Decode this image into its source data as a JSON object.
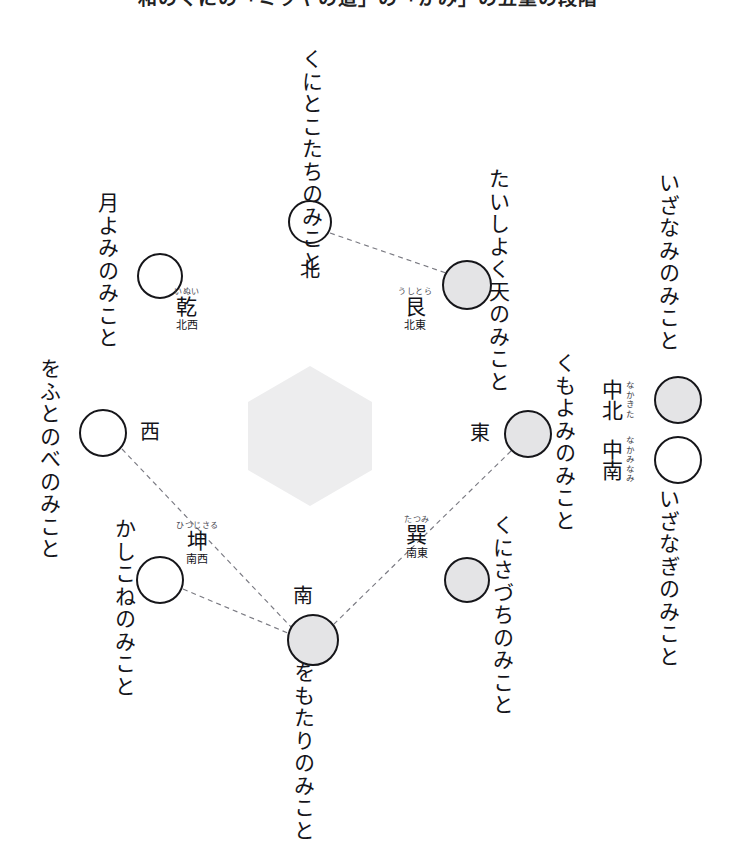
{
  "title": "和のくにの「ミヲヤの道」の「かみ」の五重の段階",
  "colors": {
    "ink": "#16161a",
    "node_white": "#ffffff",
    "node_gray": "#e4e4e6",
    "hexagon": "#ededee",
    "dashed_line": "#7a7a82",
    "ruby": "#4a4a52"
  },
  "hexagon": {
    "name": "center-hexagon",
    "fill": "#ededee"
  },
  "nodes": [
    {
      "id": "north",
      "fill": "white",
      "cx": 310,
      "cy": 222,
      "r": 22
    },
    {
      "id": "northeast",
      "fill": "gray",
      "cx": 467,
      "cy": 285,
      "r": 25
    },
    {
      "id": "northwest",
      "fill": "white",
      "cx": 160,
      "cy": 276,
      "r": 23
    },
    {
      "id": "west",
      "fill": "white",
      "cx": 103,
      "cy": 433,
      "r": 24
    },
    {
      "id": "southwest",
      "fill": "white",
      "cx": 160,
      "cy": 580,
      "r": 24
    },
    {
      "id": "south",
      "fill": "gray",
      "cx": 313,
      "cy": 640,
      "r": 26
    },
    {
      "id": "southeast",
      "fill": "gray",
      "cx": 467,
      "cy": 580,
      "r": 23
    },
    {
      "id": "east",
      "fill": "gray",
      "cx": 528,
      "cy": 434,
      "r": 24
    },
    {
      "id": "center_north",
      "fill": "gray",
      "cx": 678,
      "cy": 400,
      "r": 24
    },
    {
      "id": "center_south",
      "fill": "white",
      "cx": 678,
      "cy": 460,
      "r": 24
    }
  ],
  "edges": [
    {
      "from": "north",
      "to": "northeast"
    },
    {
      "from": "west",
      "to": "south"
    },
    {
      "from": "southwest",
      "to": "south"
    },
    {
      "from": "east",
      "to": "south"
    }
  ],
  "deities": {
    "north": "くにとこたちのみこと",
    "northeast": "たいしよく天のみこと",
    "northwest": "月よみのみこと",
    "west": "をふとのべのみこと",
    "southwest": "かしこねのみこと",
    "south": "をもたりのみこと",
    "southeast": "くにさづちのみこと",
    "east": "くもよみのみこと",
    "center_north": "いざなみのみこと",
    "center_south": "いざなぎのみこと"
  },
  "directions": {
    "north": "北",
    "east": "東",
    "south": "南",
    "west": "西"
  },
  "trigrams": {
    "northeast": {
      "ruby": "うしとら",
      "kanji": "艮",
      "gloss": "北東"
    },
    "northwest": {
      "ruby": "いぬい",
      "kanji": "乾",
      "gloss": "北西"
    },
    "southwest": {
      "ruby": "ひつじさる",
      "kanji": "坤",
      "gloss": "南西"
    },
    "southeast": {
      "ruby": "たつみ",
      "kanji": "巽",
      "gloss": "南東"
    }
  },
  "center_labels": {
    "center_north": {
      "kanji": "中北",
      "ruby": "なかきた"
    },
    "center_south": {
      "kanji": "中南",
      "ruby": "なかみなみ"
    }
  }
}
